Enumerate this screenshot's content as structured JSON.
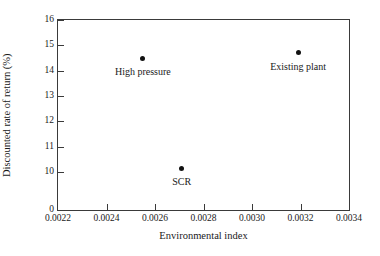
{
  "chart_data": {
    "type": "scatter",
    "title": "",
    "xlabel": "Environmental index",
    "ylabel": "Discounted rate of return (%)",
    "xlim": [
      0.0022,
      0.0034
    ],
    "ylim": [
      10,
      16
    ],
    "grid": false,
    "legend": "none",
    "x_ticks": [
      "0.0022",
      "0.0024",
      "0.0026",
      "0.0028",
      "0.0030",
      "0.0032",
      "0.0034"
    ],
    "x_tick_values": [
      0.0022,
      0.0024,
      0.0026,
      0.0028,
      0.003,
      0.0032,
      0.0034
    ],
    "y_ticks": [
      "0",
      "10",
      "11",
      "12",
      "13",
      "14",
      "15",
      "16"
    ],
    "y_tick_values": [
      0,
      10,
      11,
      12,
      13,
      14,
      15,
      16
    ],
    "y_axis_note": "axis broken between 0 and 10",
    "points": [
      {
        "label": "High pressure",
        "x": 0.00255,
        "y": 14.5
      },
      {
        "label": "SCR",
        "x": 0.00271,
        "y": 10.15
      },
      {
        "label": "Existing plant",
        "x": 0.00319,
        "y": 14.7
      }
    ],
    "marker_color": "#111111"
  }
}
